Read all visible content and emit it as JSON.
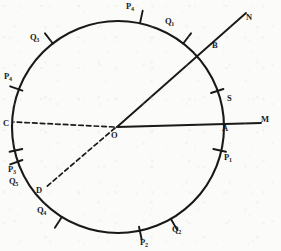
{
  "figure": {
    "type": "geometry-diagram",
    "background_color": "#fbfbfa",
    "ink_color": "#191919",
    "circle": {
      "cx": 118,
      "cy": 127,
      "r": 106,
      "stroke_width": 2.0
    },
    "center_label": "O",
    "lines": [
      {
        "name": "line-OM",
        "from": "O",
        "to": "M",
        "style": "solid",
        "label": "M"
      },
      {
        "name": "line-ON",
        "from": "O",
        "to": "N",
        "style": "solid",
        "label": "N"
      },
      {
        "name": "line-OC",
        "from": "O",
        "to": "C",
        "style": "dashed",
        "label": "C"
      },
      {
        "name": "line-OD",
        "from": "O",
        "to": "D",
        "style": "dashed",
        "label": "D"
      }
    ],
    "ray_labels": [
      {
        "id": "M",
        "text": "M",
        "x": 264,
        "y": 120
      },
      {
        "id": "N",
        "text": "N",
        "x": 248,
        "y": 18
      }
    ],
    "points": [
      {
        "id": "O",
        "text": "O",
        "x": 114,
        "y": 129
      },
      {
        "id": "A",
        "text": "A",
        "x": 222,
        "y": 127
      },
      {
        "id": "B",
        "text": "B",
        "x": 212,
        "y": 46
      },
      {
        "id": "S",
        "text": "S",
        "x": 227,
        "y": 98
      },
      {
        "id": "C",
        "text": "C",
        "x": 4,
        "y": 122
      },
      {
        "id": "D",
        "text": "D",
        "x": 37,
        "y": 189
      }
    ],
    "graduations": [
      {
        "id": "P1",
        "base": "P",
        "sub": "1",
        "angle_deg": -12,
        "x": 224,
        "y": 140
      },
      {
        "id": "P2",
        "base": "P",
        "sub": "2",
        "angle_deg": -102,
        "x": 138,
        "y": 239
      },
      {
        "id": "P3",
        "base": "P",
        "sub": "3",
        "angle_deg": 192,
        "x": 9,
        "y": 167
      },
      {
        "id": "P4",
        "base": "P",
        "sub": "4",
        "angle_deg": 160,
        "x": 5,
        "y": 70
      },
      {
        "id": "P4t",
        "base": "P",
        "sub": "4",
        "angle_deg": 78,
        "x": 127,
        "y": 3
      },
      {
        "id": "Q1",
        "base": "Q",
        "sub": "1",
        "angle_deg": 52,
        "x": 166,
        "y": 14
      },
      {
        "id": "Q2",
        "base": "Q",
        "sub": "2",
        "angle_deg": -60,
        "x": 173,
        "y": 226
      },
      {
        "id": "Q3",
        "base": "Q",
        "sub": "3",
        "angle_deg": 128,
        "x": 31,
        "y": 34
      },
      {
        "id": "Q4",
        "base": "Q",
        "sub": "4",
        "angle_deg": -122,
        "x": 38,
        "y": 207
      },
      {
        "id": "Q5",
        "base": "Q",
        "sub": "5",
        "angle_deg": 198,
        "x": 10,
        "y": 180
      }
    ]
  }
}
